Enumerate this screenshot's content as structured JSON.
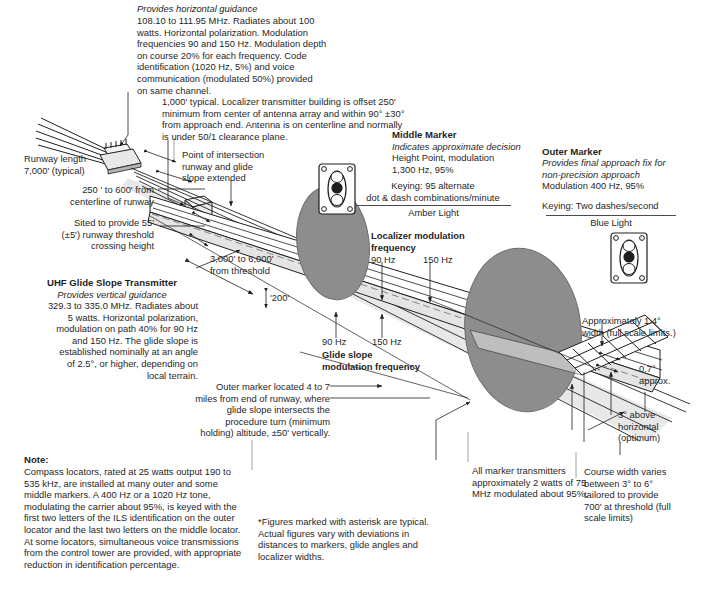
{
  "diagram": {
    "colors": {
      "ink": "#1f1f1f",
      "beam_fill": "#ffffff",
      "marker_fill": "#8d8d8d",
      "shadow": "#c9c9c9"
    }
  },
  "callouts": {
    "localizer": {
      "line1": "Provides horizontal guidance",
      "body": "108.10 to 111.95 MHz. Radiates about 100\nwatts. Horizontal polarization. Modulation\nfrequencies 90 and 150 Hz. Modulation depth\non course 20% for each frequency. Code\nidentification (1020 Hz, 5%) and voice\ncommunication (modulated 50%) provided\non same channel."
    },
    "transmitter_building": {
      "body": "1,000' typical. Localizer transmitter building is offset 250'\nminimum from center of antenna array and within 90° ±30°\nfrom approach end. Antenna is on centerline and normally\nis under 50/1 clearance plane."
    },
    "runway_length": {
      "body": "Runway length\n7,000' (typical)"
    },
    "offset_distance": {
      "body": "250 ' to 600' from\ncenterline of runway"
    },
    "threshold_crossing": {
      "body": "Sited to provide 55'\n(±5') runway threshold\ncrossing height"
    },
    "glide_slope_transmitter": {
      "title": "UHF Glide Slope Transmitter",
      "italic": "Provides vertical guidance",
      "body": "329.3 to 335.0 MHz. Radiates about\n5 watts. Horizontal polarization,\nmodulation on path 40% for 90 Hz\nand 150 Hz. The glide slope is\nestablished nominally at an angle\nof 2.5°, or higher, depending on\nlocal terrain."
    },
    "point_of_intersection": {
      "body": "Point of intersection\nrunway and glide\nslope extended"
    },
    "distance_from_threshold": {
      "body": "3,000' to 6,000'\nfrom threshold"
    },
    "two_hundred": {
      "body": "'200'"
    },
    "middle_marker": {
      "title": "Middle Marker",
      "italic": "Indicates approximate decision",
      "body": "Height Point, modulation\n1,300 Hz, 95%",
      "keying": "Keying: 95 alternate\ndot & dash combinations/minute",
      "light": "Amber Light"
    },
    "outer_marker": {
      "title": "Outer Marker",
      "italic": "Provides final approach fix for\nnon-precision approach",
      "body": "Modulation 400 Hz, 95%",
      "keying": "Keying: Two dashes/second",
      "light": "Blue Light"
    },
    "localizer_modulation": {
      "title": "Localizer modulation\nfrequency",
      "left_label": "90 Hz",
      "right_label": "150 Hz"
    },
    "glide_slope_modulation": {
      "left_label": "90 Hz",
      "right_label": "150 Hz",
      "title": "Glide slope\nmodulation frequency"
    },
    "outer_marker_location": {
      "body": "Outer marker located 4 to 7\nmiles from end of runway, where\nglide slope intersects the\nprocedure turn (minimum\nholding) altitude, ±50' vertically."
    },
    "beam_width": {
      "body": "Approximately 1.4°\nwidth (full scale limits.)"
    },
    "half_width": {
      "body": "0.7°\napprox."
    },
    "above_horizontal": {
      "body": "3° above\nhorizontal\n(optimum)"
    },
    "course_width": {
      "body": "Course width varies\nbetween 3° to 6°\ntailored to provide\n700' at threshold (full\nscale limits)"
    },
    "marker_transmitters": {
      "body": "All marker transmitters\napproximately 2 watts of 75\nMHz modulated about 95%."
    },
    "asterisk_note": {
      "body": "*Figures marked with asterisk are typical.\nActual figures vary with deviations in\ndistances to markers, glide angles and\nlocalizer widths."
    },
    "note": {
      "title": "Note:",
      "body": "Compass locators, rated at 25 watts output 190 to\n535 kHz, are installed at many outer and some\nmiddle markers. A 400 Hz or a 1020 Hz tone,\nmodulating the carrier about 95%, is keyed with the\nfirst two letters of the ILS identification on the outer\nlocator and the last two letters on the middle locator.\nAt some locators, simultaneous voice transmissions\nfrom the control tower are provided, with appropriate\nreduction in identification percentage."
    }
  },
  "icons": {
    "middle_marker_beacon": "marker-beacon-icon",
    "outer_marker_beacon": "marker-beacon-icon"
  }
}
